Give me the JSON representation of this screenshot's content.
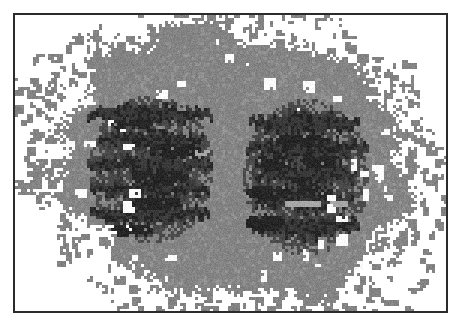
{
  "figure": {
    "kind": "raster-scan-image",
    "canvas_width": 461,
    "canvas_height": 326,
    "background_color": "#ffffff"
  },
  "frame": {
    "name": "image-border",
    "x": 13,
    "y": 13,
    "width": 435,
    "height": 300,
    "border_width": 2,
    "border_color": "#2b2b2b",
    "fill_color": "#ffffff"
  },
  "scan": {
    "origin_x": 15,
    "origin_y": 15,
    "width": 431,
    "height": 296,
    "pixel_block": 3,
    "noise_seed": 20240517,
    "palette": {
      "background": "#ffffff",
      "mid_gray": "#838383",
      "mid_gray_light": "#919191",
      "dark_gray": "#4a4a4a",
      "darker_gray": "#3a3a3a",
      "darkest": "#262626",
      "hole_white": "#fdfdfd",
      "light_streak": "#a8a8a8"
    },
    "grain": {
      "amplitude": 13,
      "enabled": true
    },
    "body": {
      "label": "outer-gray-mass",
      "center_x": 232,
      "center_y": 162,
      "radius_x": 182,
      "radius_y": 122,
      "edge_roughness": 26,
      "edge_frequency": 0.085,
      "fill": "mid_gray"
    },
    "speckle_fringe": {
      "label": "perimeter-noise-speckles",
      "count": 540,
      "inner_scale": 0.96,
      "outer_scale": 1.3,
      "min_block": 3,
      "max_block": 9,
      "fill": "mid_gray"
    },
    "interior_holes": {
      "label": "white-void-pockets",
      "count": 46,
      "band_inner": 0.62,
      "band_outer": 1.02,
      "min_block": 3,
      "max_block": 12,
      "fill": "hole_white"
    },
    "lobes": [
      {
        "label": "left-dark-lobe",
        "center_x": 150,
        "center_y": 168,
        "radius_x": 62,
        "radius_y": 74,
        "stripe_count": 5,
        "stripe_thickness": 13,
        "stripe_gap": 25,
        "stripe_first_y": 114,
        "stripe_jitter": 9,
        "stripe_fill": "darker_gray",
        "core_fill": "darkest",
        "core_blobs": [
          {
            "x": 172,
            "y": 148,
            "rx": 26,
            "ry": 8
          },
          {
            "x": 160,
            "y": 176,
            "rx": 30,
            "ry": 8
          },
          {
            "x": 156,
            "y": 203,
            "rx": 27,
            "ry": 7
          },
          {
            "x": 128,
            "y": 230,
            "rx": 24,
            "ry": 7
          },
          {
            "x": 132,
            "y": 122,
            "rx": 20,
            "ry": 6
          }
        ]
      },
      {
        "label": "right-dark-lobe",
        "center_x": 305,
        "center_y": 176,
        "radius_x": 63,
        "radius_y": 78,
        "stripe_count": 5,
        "stripe_thickness": 15,
        "stripe_gap": 26,
        "stripe_first_y": 122,
        "stripe_jitter": 10,
        "stripe_fill": "darker_gray",
        "core_fill": "darkest",
        "core_blobs": [
          {
            "x": 272,
            "y": 160,
            "rx": 20,
            "ry": 8
          },
          {
            "x": 318,
            "y": 160,
            "rx": 22,
            "ry": 7
          },
          {
            "x": 268,
            "y": 190,
            "rx": 24,
            "ry": 8
          },
          {
            "x": 312,
            "y": 190,
            "rx": 18,
            "ry": 7
          },
          {
            "x": 265,
            "y": 222,
            "rx": 21,
            "ry": 8
          },
          {
            "x": 300,
            "y": 140,
            "rx": 26,
            "ry": 7
          }
        ]
      }
    ],
    "light_streaks": [
      {
        "label": "streak-right-upper",
        "x": 286,
        "y": 200,
        "width": 34,
        "height": 5
      },
      {
        "label": "streak-right-lower",
        "x": 330,
        "y": 200,
        "width": 16,
        "height": 5
      },
      {
        "label": "streak-left-mid",
        "x": 196,
        "y": 150,
        "width": 14,
        "height": 5
      }
    ],
    "outlier_pixels": [
      {
        "x": 160,
        "y": 38,
        "size": 4
      },
      {
        "x": 186,
        "y": 32,
        "size": 4
      },
      {
        "x": 206,
        "y": 44,
        "size": 4
      },
      {
        "x": 212,
        "y": 44,
        "size": 4
      },
      {
        "x": 228,
        "y": 35,
        "size": 5
      },
      {
        "x": 240,
        "y": 47,
        "size": 4
      },
      {
        "x": 265,
        "y": 32,
        "size": 4
      },
      {
        "x": 276,
        "y": 44,
        "size": 4
      },
      {
        "x": 290,
        "y": 35,
        "size": 5
      },
      {
        "x": 312,
        "y": 43,
        "size": 4
      },
      {
        "x": 334,
        "y": 37,
        "size": 4
      },
      {
        "x": 352,
        "y": 50,
        "size": 4
      },
      {
        "x": 372,
        "y": 58,
        "size": 4
      },
      {
        "x": 120,
        "y": 60,
        "size": 4
      },
      {
        "x": 96,
        "y": 78,
        "size": 4
      },
      {
        "x": 84,
        "y": 95,
        "size": 4
      },
      {
        "x": 62,
        "y": 112,
        "size": 4
      },
      {
        "x": 44,
        "y": 150,
        "size": 4
      },
      {
        "x": 40,
        "y": 162,
        "size": 5
      },
      {
        "x": 50,
        "y": 196,
        "size": 4
      },
      {
        "x": 58,
        "y": 236,
        "size": 4
      },
      {
        "x": 404,
        "y": 96,
        "size": 4
      },
      {
        "x": 420,
        "y": 118,
        "size": 4
      },
      {
        "x": 436,
        "y": 158,
        "size": 6
      },
      {
        "x": 424,
        "y": 176,
        "size": 4
      },
      {
        "x": 412,
        "y": 210,
        "size": 4
      },
      {
        "x": 396,
        "y": 236,
        "size": 5
      },
      {
        "x": 380,
        "y": 258,
        "size": 4
      },
      {
        "x": 344,
        "y": 272,
        "size": 4
      },
      {
        "x": 300,
        "y": 286,
        "size": 4
      },
      {
        "x": 252,
        "y": 292,
        "size": 4
      },
      {
        "x": 212,
        "y": 286,
        "size": 4
      },
      {
        "x": 176,
        "y": 280,
        "size": 4
      },
      {
        "x": 140,
        "y": 272,
        "size": 4
      },
      {
        "x": 196,
        "y": 298,
        "size": 4
      }
    ]
  }
}
